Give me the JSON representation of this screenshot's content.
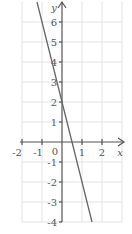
{
  "chart_data": {
    "type": "line",
    "title": "",
    "xlabel": "x",
    "ylabel": "y",
    "xlim": [
      -2,
      3
    ],
    "ylim": [
      -4,
      7
    ],
    "x_ticks": [
      "-2",
      "-1",
      "0",
      "1",
      "2"
    ],
    "y_ticks": [
      "6",
      "5",
      "4",
      "3",
      "2",
      "1",
      "-1",
      "-2",
      "-3",
      "-4"
    ],
    "grid": true,
    "series": [
      {
        "name": "y = -4x + 2",
        "x": [
          -1.25,
          1.5
        ],
        "y": [
          7,
          -4
        ]
      }
    ],
    "colors": {
      "grid": "#e0e0e0",
      "axis": "#555555",
      "line": "#666666"
    }
  }
}
